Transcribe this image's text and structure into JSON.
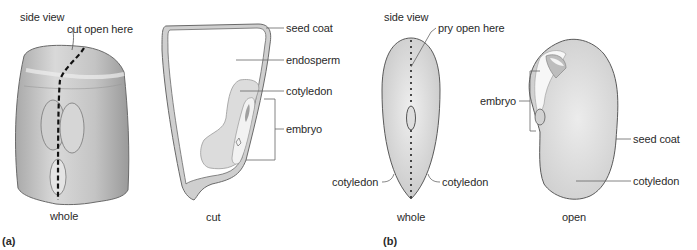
{
  "figure": {
    "panel_a": {
      "letter": "(a)",
      "whole": {
        "title": "side view",
        "annotation": "cut open here",
        "caption": "whole"
      },
      "cut": {
        "caption": "cut",
        "labels": {
          "seed_coat": "seed coat",
          "endosperm": "endosperm",
          "cotyledon": "cotyledon",
          "embryo": "embryo"
        }
      }
    },
    "panel_b": {
      "letter": "(b)",
      "whole": {
        "title": "side view",
        "annotation": "pry open here",
        "caption": "whole",
        "left_label": "cotyledon",
        "right_label": "cotyledon"
      },
      "open": {
        "caption": "open",
        "labels": {
          "embryo": "embryo",
          "seed_coat": "seed coat",
          "cotyledon": "cotyledon"
        }
      }
    },
    "colors": {
      "outline": "#5a5a5a",
      "seed_fill": "#d8d8d8",
      "coat_fill": "#cfcfcf",
      "leader": "#666666",
      "text": "#2a2a2a"
    }
  }
}
